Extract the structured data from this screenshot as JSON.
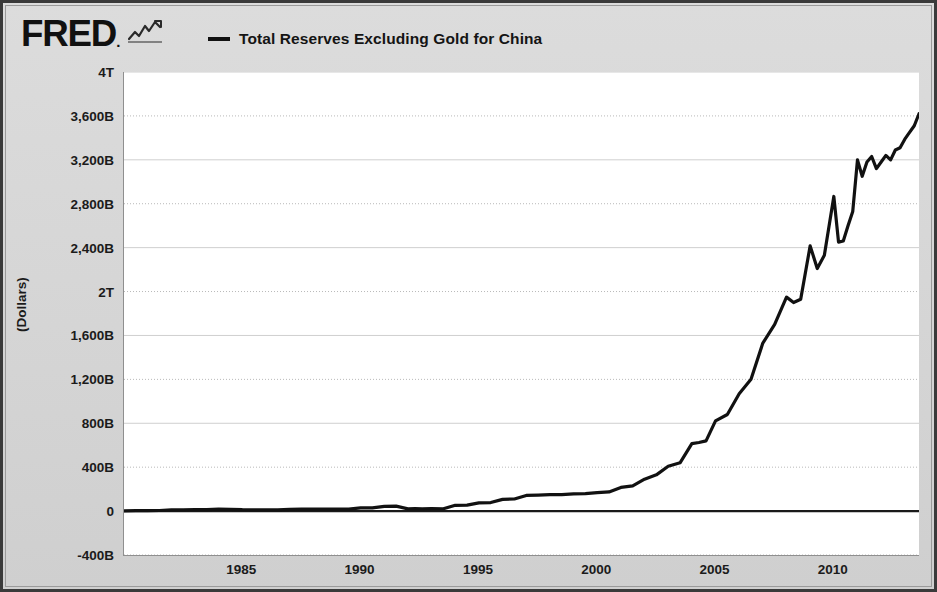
{
  "header": {
    "logo_text": "FRED",
    "logo_dot": ".",
    "logo_icon": "squiggle-chart-icon",
    "legend": [
      {
        "label": "Total Reserves Excluding Gold for China",
        "color": "#111111"
      }
    ]
  },
  "chart_data": {
    "type": "line",
    "title": "Total Reserves Excluding Gold for China",
    "xlabel": "",
    "ylabel": "(Dollars)",
    "ylim": [
      -400000000000,
      4000000000000
    ],
    "xlim": [
      1980.0,
      2013.6
    ],
    "grid": true,
    "legend_position": "top",
    "ytick_labels": [
      "4T",
      "3,600B",
      "3,200B",
      "2,800B",
      "2,400B",
      "2T",
      "1,600B",
      "1,200B",
      "800B",
      "400B",
      "0",
      "-400B"
    ],
    "ytick_values": [
      4000,
      3600,
      3200,
      2800,
      2400,
      2000,
      1600,
      1200,
      800,
      400,
      0,
      -400
    ],
    "ytick_unit": "billions of dollars",
    "xtick_labels": [
      "1985",
      "1990",
      "1995",
      "2000",
      "2005",
      "2010"
    ],
    "xtick_values": [
      1985,
      1990,
      1995,
      2000,
      2005,
      2010
    ],
    "series": [
      {
        "name": "Total Reserves Excluding Gold for China",
        "color": "#111111",
        "units": "billions of dollars",
        "x": [
          1980.0,
          1980.5,
          1981.0,
          1981.5,
          1982.0,
          1982.5,
          1983.0,
          1983.5,
          1984.0,
          1984.5,
          1985.0,
          1985.5,
          1986.0,
          1986.5,
          1987.0,
          1987.5,
          1988.0,
          1988.5,
          1989.0,
          1989.5,
          1990.0,
          1990.5,
          1991.0,
          1991.5,
          1992.0,
          1992.3,
          1992.6,
          1993.0,
          1993.5,
          1994.0,
          1994.5,
          1995.0,
          1995.5,
          1996.0,
          1996.5,
          1997.0,
          1997.5,
          1998.0,
          1998.5,
          1999.0,
          1999.5,
          2000.0,
          2000.5,
          2001.0,
          2001.5,
          2002.0,
          2002.5,
          2003.0,
          2003.5,
          2004.0,
          2004.3,
          2004.6,
          2005.0,
          2005.5,
          2006.0,
          2006.5,
          2007.0,
          2007.5,
          2008.0,
          2008.3,
          2008.6,
          2009.0,
          2009.3,
          2009.6,
          2010.0,
          2010.2,
          2010.4,
          2010.6,
          2010.8,
          2011.0,
          2011.2,
          2011.4,
          2011.6,
          2011.8,
          2012.0,
          2012.2,
          2012.4,
          2012.6,
          2012.8,
          2013.0,
          2013.2,
          2013.4,
          2013.6
        ],
        "y": [
          2.5,
          4.0,
          5.0,
          5.5,
          11.0,
          11.5,
          14.5,
          14.0,
          17.0,
          16.5,
          12.7,
          11.5,
          11.5,
          11.0,
          16.3,
          17.0,
          18.5,
          18.0,
          17.9,
          17.5,
          29.6,
          30.0,
          43.7,
          45.0,
          20.6,
          22.0,
          19.4,
          22.4,
          21.5,
          52.9,
          54.0,
          75.4,
          78.0,
          107.0,
          110.0,
          142.8,
          145.0,
          149.2,
          150.0,
          157.7,
          158.5,
          168.3,
          175.0,
          215.6,
          230.0,
          291.1,
          330.0,
          408.2,
          440.0,
          614.5,
          625.0,
          640.0,
          821.5,
          880.0,
          1068.5,
          1200.0,
          1530.3,
          1700.0,
          1949.3,
          1900.0,
          1930.0,
          2416.0,
          2210.0,
          2330.0,
          2866.1,
          2450.0,
          2460.0,
          2600.0,
          2730.0,
          3200.0,
          3050.0,
          3180.0,
          3230.0,
          3120.0,
          3180.0,
          3240.0,
          3200.0,
          3290.0,
          3310.0,
          3388.0,
          3450.0,
          3510.0,
          3620.0
        ]
      }
    ]
  }
}
